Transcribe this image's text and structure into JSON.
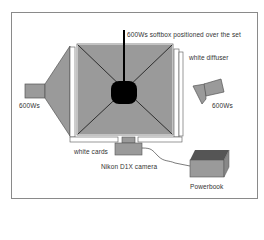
{
  "diagram": {
    "type": "studio-lighting-setup",
    "labels": {
      "softbox_top": "600Ws softbox positioned over the set",
      "diffuser": "white diffuser",
      "light_left": "600Ws",
      "light_right": "600Ws",
      "cards": "white cards",
      "camera": "Nikon D1X camera",
      "computer": "Powerbook"
    },
    "colors": {
      "softbox_fill": "#9a9a9a",
      "dark": "#000000",
      "panel_fill": "#ffffff",
      "outline": "#555555",
      "powerbook_top": "#555555",
      "frame_border": "#8a8a8a"
    }
  }
}
